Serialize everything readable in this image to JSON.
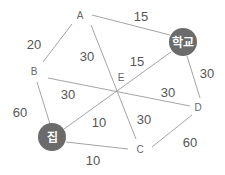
{
  "diagram": {
    "type": "weighted-graph",
    "nodes": {
      "A": "A",
      "B": "B",
      "C": "C",
      "D": "D",
      "E": "E",
      "school": "학교",
      "home": "집"
    },
    "edges": [
      {
        "from": "A",
        "to": "학교",
        "weight": "15"
      },
      {
        "from": "A",
        "to": "B",
        "weight": "20"
      },
      {
        "from": "A",
        "to": "C",
        "weight": "30"
      },
      {
        "from": "집",
        "to": "학교",
        "weight": "15"
      },
      {
        "from": "학교",
        "to": "D",
        "weight": "30"
      },
      {
        "from": "B",
        "to": "D",
        "weight": "30"
      },
      {
        "from": "B",
        "to": "D",
        "weight": "30"
      },
      {
        "from": "B",
        "to": "집",
        "weight": "60"
      },
      {
        "from": "집",
        "to": "E",
        "weight": "10"
      },
      {
        "from": "E",
        "to": "C",
        "weight": "30"
      },
      {
        "from": "집",
        "to": "C",
        "weight": "10"
      },
      {
        "from": "C",
        "to": "D",
        "weight": "60"
      }
    ],
    "weights": {
      "a_school": "15",
      "a_b": "20",
      "a_e": "30",
      "e_school": "15",
      "school_d": "30",
      "b_e": "30",
      "e_d": "30",
      "b_home": "60",
      "home_e": "10",
      "e_c": "30",
      "home_c": "10",
      "c_d": "60"
    },
    "colors": {
      "special_node": "#6b6b6b",
      "edge": "#9a9a9a",
      "text": "#555555"
    }
  }
}
